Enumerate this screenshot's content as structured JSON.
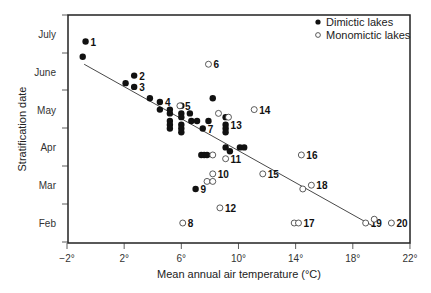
{
  "chart_data": {
    "type": "scatter",
    "title": "",
    "xlabel": "Mean annual air temperature (°C)",
    "ylabel": "Stratification date",
    "xlim": [
      -2,
      22
    ],
    "x_ticks": [
      "−2°",
      "2°",
      "6°",
      "10°",
      "14°",
      "18°",
      "22°"
    ],
    "x_tick_values": [
      -2,
      2,
      6,
      10,
      14,
      18,
      22
    ],
    "y_ticks": [
      "Feb",
      "Mar",
      "Apr",
      "May",
      "June",
      "July"
    ],
    "y_tick_values": [
      2,
      3,
      4,
      5,
      6,
      7
    ],
    "ylim": [
      1.5,
      7.5
    ],
    "grid": false,
    "legend_position": "top-right",
    "legend": [
      {
        "name": "Dimictic lakes",
        "marker": "filled-circle"
      },
      {
        "name": "Monomictic lakes",
        "marker": "open-circle"
      }
    ],
    "series": [
      {
        "name": "Dimictic lakes",
        "marker": "filled",
        "points": [
          {
            "x": -0.7,
            "y": 6.8,
            "label": "1"
          },
          {
            "x": -0.9,
            "y": 6.4
          },
          {
            "x": 2.1,
            "y": 5.7
          },
          {
            "x": 2.7,
            "y": 5.9,
            "label": "2"
          },
          {
            "x": 2.7,
            "y": 5.6,
            "label": "3"
          },
          {
            "x": 3.8,
            "y": 5.3
          },
          {
            "x": 4.5,
            "y": 5.2,
            "label": "4"
          },
          {
            "x": 4.5,
            "y": 5.0
          },
          {
            "x": 5.2,
            "y": 5.0
          },
          {
            "x": 5.2,
            "y": 4.9
          },
          {
            "x": 5.2,
            "y": 4.7
          },
          {
            "x": 5.2,
            "y": 4.6
          },
          {
            "x": 5.2,
            "y": 4.5
          },
          {
            "x": 6.0,
            "y": 5.1
          },
          {
            "x": 6.0,
            "y": 4.9
          },
          {
            "x": 6.0,
            "y": 4.8
          },
          {
            "x": 6.0,
            "y": 4.6
          },
          {
            "x": 6.0,
            "y": 4.5
          },
          {
            "x": 6.0,
            "y": 4.4
          },
          {
            "x": 6.6,
            "y": 4.9
          },
          {
            "x": 6.7,
            "y": 4.7
          },
          {
            "x": 7.1,
            "y": 4.7
          },
          {
            "x": 7.5,
            "y": 4.5,
            "label": "7"
          },
          {
            "x": 7.9,
            "y": 4.7
          },
          {
            "x": 8.2,
            "y": 5.3
          },
          {
            "x": 9.1,
            "y": 4.8
          },
          {
            "x": 9.1,
            "y": 4.6,
            "label": "13"
          },
          {
            "x": 9.1,
            "y": 4.5
          },
          {
            "x": 9.1,
            "y": 4.4
          },
          {
            "x": 9.1,
            "y": 4.0
          },
          {
            "x": 9.4,
            "y": 3.9
          },
          {
            "x": 10.1,
            "y": 4.0
          },
          {
            "x": 10.4,
            "y": 4.0
          },
          {
            "x": 7.4,
            "y": 3.8
          },
          {
            "x": 7.6,
            "y": 3.8
          },
          {
            "x": 7.8,
            "y": 3.8
          },
          {
            "x": 7.0,
            "y": 2.9,
            "label": "9"
          }
        ]
      },
      {
        "name": "Monomictic lakes",
        "marker": "open",
        "points": [
          {
            "x": 7.9,
            "y": 6.2,
            "label": "6"
          },
          {
            "x": 5.9,
            "y": 5.1,
            "label": "5"
          },
          {
            "x": 8.6,
            "y": 4.9
          },
          {
            "x": 9.3,
            "y": 4.8
          },
          {
            "x": 11.1,
            "y": 5.0,
            "label": "14"
          },
          {
            "x": 8.2,
            "y": 3.8
          },
          {
            "x": 9.1,
            "y": 3.7,
            "label": "11"
          },
          {
            "x": 8.2,
            "y": 3.3,
            "label": "10"
          },
          {
            "x": 7.8,
            "y": 3.1
          },
          {
            "x": 8.2,
            "y": 3.1
          },
          {
            "x": 8.7,
            "y": 2.4,
            "label": "12"
          },
          {
            "x": 6.1,
            "y": 2.0,
            "label": "8"
          },
          {
            "x": 11.7,
            "y": 3.3,
            "label": "15"
          },
          {
            "x": 14.4,
            "y": 3.8,
            "label": "16"
          },
          {
            "x": 14.5,
            "y": 2.9
          },
          {
            "x": 15.1,
            "y": 3.0,
            "label": "18"
          },
          {
            "x": 13.9,
            "y": 2.0
          },
          {
            "x": 14.2,
            "y": 2.0,
            "label": "17"
          },
          {
            "x": 18.9,
            "y": 2.0,
            "label": "19"
          },
          {
            "x": 19.5,
            "y": 2.1
          },
          {
            "x": 20.7,
            "y": 2.0,
            "label": "20"
          }
        ]
      }
    ],
    "regression_line": {
      "x": [
        -0.8,
        19.5
      ],
      "y": [
        6.2,
        1.9
      ]
    }
  }
}
